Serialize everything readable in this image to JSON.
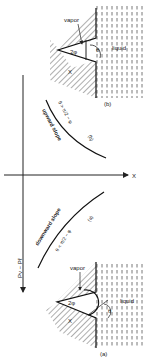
{
  "diagram": {
    "panel_b": {
      "vapor_label": "vapor",
      "liquid_label": "liquid",
      "angle_label": "2φ",
      "theta_label": "θ",
      "x_label": "X",
      "caption": "(b)"
    },
    "panel_a": {
      "vapor_label": "vapor",
      "liquid_label": "liquid",
      "angle_label": "2φ",
      "theta_label": "θ",
      "x_label": "X",
      "caption": "(a)"
    },
    "plot": {
      "x_axis_label": "X",
      "y_axis_label": "Pv − Pℓ",
      "upper_curve": {
        "slope_label": "upward slope",
        "condition": "θ > π/2 − φ",
        "tag": "(b)"
      },
      "lower_curve": {
        "slope_label": "downward slope",
        "condition": "θ < π/2 − φ",
        "tag": "(a)"
      }
    }
  }
}
